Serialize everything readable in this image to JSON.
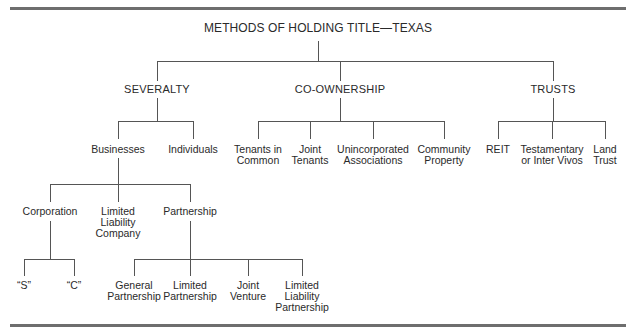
{
  "title": "METHODS OF HOLDING TITLE—TEXAS",
  "categories": {
    "severalty": "SEVERALTY",
    "co_ownership": "CO-OWNERSHIP",
    "trusts": "TRUSTS"
  },
  "severalty_children": {
    "businesses": "Businesses",
    "individuals": "Individuals"
  },
  "co_ownership_children": [
    "Tenants in\nCommon",
    "Joint\nTenants",
    "Unincorporated\nAssociations",
    "Community\nProperty"
  ],
  "trusts_children": [
    "REIT",
    "Testamentary\nor Inter Vivos",
    "Land\nTrust"
  ],
  "business_children": {
    "corporation": "Corporation",
    "llc": "Limited\nLiability\nCompany",
    "partnership": "Partnership"
  },
  "corporation_children": [
    "“S”",
    "“C”"
  ],
  "partnership_children": [
    "General\nPartnership",
    "Limited\nPartnership",
    "Joint\nVenture",
    "Limited\nLiability\nPartnership"
  ]
}
